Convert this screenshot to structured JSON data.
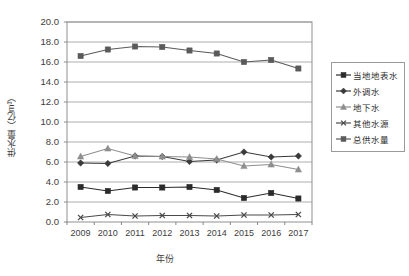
{
  "chart_data": {
    "type": "line",
    "title": "",
    "xlabel": "年份",
    "ylabel": "供水量（亿m³）",
    "categories": [
      "2009",
      "2010",
      "2011",
      "2012",
      "2013",
      "2014",
      "2015",
      "2016",
      "2017"
    ],
    "ylim": [
      0.0,
      20.0
    ],
    "ytick_step": 2.0,
    "ytick_labels": [
      "0.0",
      "2.0",
      "4.0",
      "6.0",
      "8.0",
      "10.0",
      "12.0",
      "14.0",
      "16.0",
      "18.0",
      "20.0"
    ],
    "grid": "horizontal",
    "legend_position": "right",
    "series": [
      {
        "name": "当地地表水",
        "marker": "square",
        "color": "#2b2b2b",
        "values": [
          3.5,
          3.1,
          3.45,
          3.45,
          3.5,
          3.2,
          2.4,
          2.9,
          2.35
        ]
      },
      {
        "name": "外调水",
        "marker": "diamond",
        "color": "#3a3a3a",
        "values": [
          5.9,
          5.85,
          6.6,
          6.55,
          6.05,
          6.2,
          7.0,
          6.5,
          6.6
        ]
      },
      {
        "name": "地下水",
        "marker": "triangle",
        "color": "#8e8e8e",
        "values": [
          6.55,
          7.35,
          6.6,
          6.55,
          6.5,
          6.3,
          5.6,
          5.75,
          5.25
        ]
      },
      {
        "name": "其他水源",
        "marker": "cross",
        "color": "#4a4a4a",
        "values": [
          0.45,
          0.75,
          0.6,
          0.65,
          0.65,
          0.6,
          0.7,
          0.7,
          0.75
        ]
      },
      {
        "name": "总供水量",
        "marker": "square",
        "color": "#5a5a5a",
        "values": [
          16.6,
          17.25,
          17.55,
          17.5,
          17.15,
          16.85,
          16.0,
          16.2,
          15.35
        ]
      }
    ]
  },
  "axis": {
    "y_title": "供水量（亿m³）",
    "x_title": "年份"
  }
}
